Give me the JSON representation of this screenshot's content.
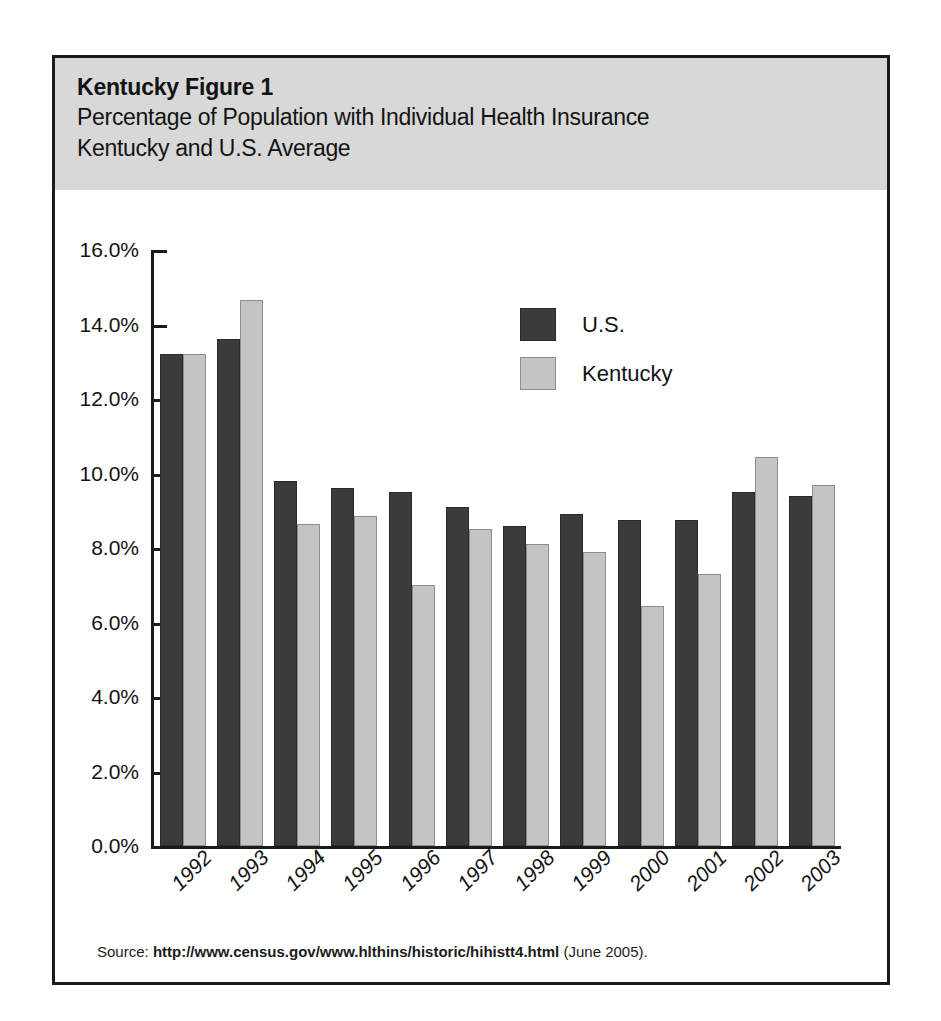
{
  "figure": {
    "label": "Kentucky Figure 1",
    "title_line1": "Percentage of Population with Individual Health Insurance",
    "title_line2": "Kentucky and U.S. Average",
    "source_prefix": "Source: ",
    "source_url": "http://www.census.gov/www.hlthins/historic/hihistt4.html",
    "source_suffix": " (June 2005)."
  },
  "colors": {
    "us_bar": "#3b3b3b",
    "ky_bar": "#c4c4c4",
    "header_band": "#d8d8d8",
    "frame": "#1b1b1b"
  },
  "chart_data": {
    "type": "bar",
    "title": "Percentage of Population with Individual Health Insurance Kentucky and U.S. Average",
    "xlabel": "",
    "ylabel": "",
    "ylim": [
      0,
      16
    ],
    "ytick_labels": [
      "16.0%",
      "14.0%",
      "12.0%",
      "10.0%",
      "8.0%",
      "6.0%",
      "4.0%",
      "2.0%",
      "0.0%"
    ],
    "ytick_values": [
      16,
      14,
      12,
      10,
      8,
      6,
      4,
      2,
      0
    ],
    "grid": false,
    "legend_position": "top-center",
    "categories": [
      "1992",
      "1993",
      "1994",
      "1995",
      "1996",
      "1997",
      "1998",
      "1999",
      "2000",
      "2001",
      "2002",
      "2003"
    ],
    "series": [
      {
        "name": "U.S.",
        "color": "#3b3b3b",
        "values": [
          13.2,
          13.6,
          9.8,
          9.6,
          9.5,
          9.1,
          8.6,
          8.9,
          8.75,
          8.75,
          9.5,
          9.4
        ]
      },
      {
        "name": "Kentucky",
        "color": "#c4c4c4",
        "values": [
          13.2,
          14.65,
          8.65,
          8.85,
          7.0,
          8.5,
          8.1,
          7.9,
          6.45,
          7.3,
          10.45,
          9.7
        ]
      }
    ]
  }
}
